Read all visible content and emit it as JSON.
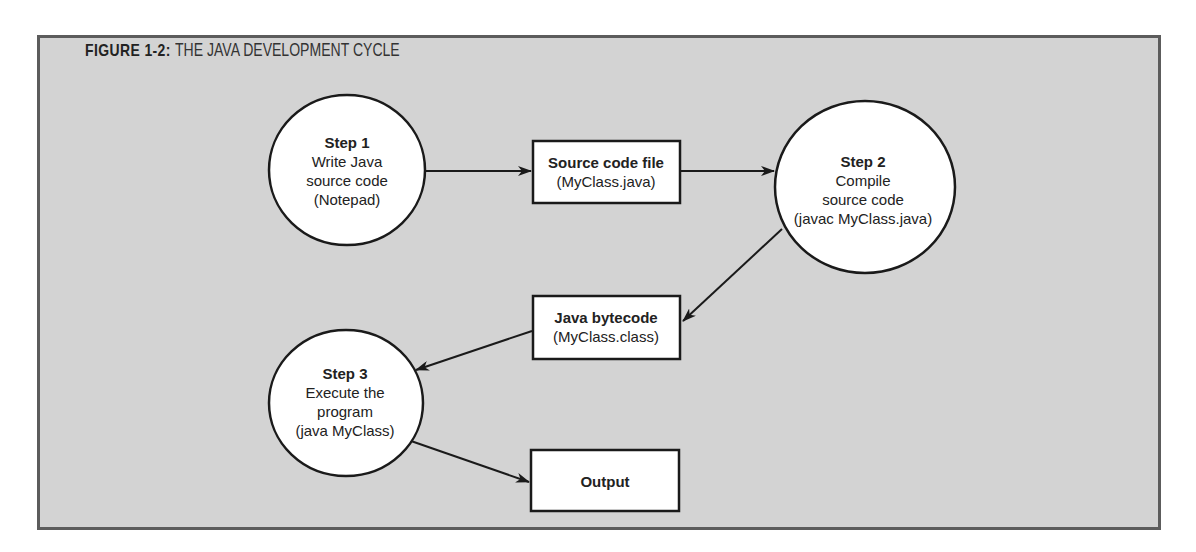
{
  "figure": {
    "label": "FIGURE 1-2:",
    "caption": "THE JAVA DEVELOPMENT CYCLE"
  },
  "colors": {
    "background": "#d3d3d3",
    "frame_border": "#5c5c5c",
    "node_fill": "#ffffff",
    "stroke": "#1a1a1a"
  },
  "nodes": {
    "step1": {
      "title": "Step 1",
      "lines": [
        "Write Java",
        "source code",
        "(Notepad)"
      ]
    },
    "source_file": {
      "title": "Source code file",
      "subtitle": "(MyClass.java)"
    },
    "step2": {
      "title": "Step 2",
      "lines": [
        "Compile",
        "source code",
        "(javac MyClass.java)"
      ]
    },
    "bytecode": {
      "title": "Java bytecode",
      "subtitle": "(MyClass.class)"
    },
    "step3": {
      "title": "Step 3",
      "lines": [
        "Execute the",
        "program",
        "(java MyClass)"
      ]
    },
    "output": {
      "title": "Output"
    }
  },
  "edges": [
    {
      "from": "step1",
      "to": "source_file"
    },
    {
      "from": "source_file",
      "to": "step2"
    },
    {
      "from": "step2",
      "to": "bytecode"
    },
    {
      "from": "bytecode",
      "to": "step3"
    },
    {
      "from": "step3",
      "to": "output"
    }
  ]
}
